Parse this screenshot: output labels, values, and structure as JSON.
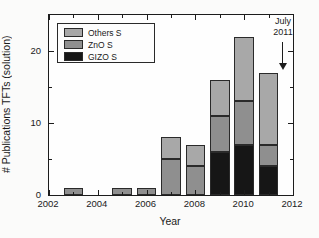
{
  "axes": {
    "ylabel": "# Publications TFTs (solution)",
    "xlabel": "Year"
  },
  "legend": {
    "items": [
      {
        "label": "Others S",
        "color": "#a8a8a8"
      },
      {
        "label": "ZnO S",
        "color": "#8f8f8f"
      },
      {
        "label": "GIZO S",
        "color": "#161616"
      }
    ]
  },
  "annotation": {
    "line1": "July",
    "line2": "2011"
  },
  "chart_data": {
    "type": "bar",
    "stacked": true,
    "title": "",
    "xlabel": "Year",
    "ylabel": "# Publications TFTs (solution)",
    "categories": [
      2003,
      2005,
      2006,
      2007,
      2008,
      2009,
      2010,
      2011
    ],
    "series": [
      {
        "name": "GIZO S",
        "color": "#161616",
        "texture": false,
        "values": [
          0,
          0,
          0,
          0,
          0,
          6,
          7,
          4
        ]
      },
      {
        "name": "ZnO S",
        "color": "#8f8f8f",
        "texture": false,
        "values": [
          1,
          1,
          1,
          5,
          4,
          5,
          6,
          3
        ]
      },
      {
        "name": "Others S",
        "color": "#a8a8a8",
        "texture": true,
        "values": [
          0,
          0,
          0,
          3,
          3,
          5,
          9,
          10
        ]
      }
    ],
    "totals": [
      1,
      1,
      1,
      8,
      7,
      16,
      22,
      17
    ],
    "xlim": [
      2002,
      2012
    ],
    "ylim": [
      0,
      25
    ],
    "x_major_ticks": [
      2002,
      2004,
      2006,
      2008,
      2010,
      2012
    ],
    "x_minor_ticks": [
      2003,
      2005,
      2007,
      2009,
      2011
    ],
    "y_major_ticks": [
      0,
      10,
      20
    ],
    "y_minor_ticks": [
      5,
      15
    ],
    "grid": false,
    "legend_position": "upper-left",
    "bar_width_years": 0.8,
    "annotation": {
      "text": "July 2011",
      "x": 2011,
      "points_to_y": 17
    }
  }
}
